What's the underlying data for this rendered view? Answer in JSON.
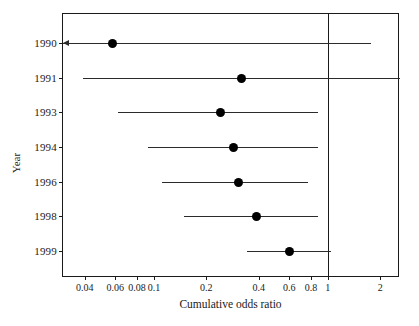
{
  "chart_data": {
    "type": "scatter",
    "subtype": "forest-plot-cumulative-meta-analysis",
    "title": "",
    "xlabel": "Cumulative odds ratio",
    "ylabel": "Year",
    "xscale": "log",
    "xlim": [
      0.03,
      2.6
    ],
    "grid": false,
    "legend": null,
    "reference_line": {
      "value": 1,
      "label": "1",
      "orientation": "vertical"
    },
    "x_ticks": [
      {
        "value": 0.04,
        "label": "0.04"
      },
      {
        "value": 0.06,
        "label": "0.06"
      },
      {
        "value": 0.08,
        "label": "0.08"
      },
      {
        "value": 0.1,
        "label": "0.1"
      },
      {
        "value": 0.2,
        "label": "0.2"
      },
      {
        "value": 0.4,
        "label": "0.4"
      },
      {
        "value": 0.6,
        "label": "0.6"
      },
      {
        "value": 0.8,
        "label": "0.8"
      },
      {
        "value": 1,
        "label": "1"
      },
      {
        "value": 2,
        "label": "2"
      }
    ],
    "categories": [
      "1990",
      "1991",
      "1993",
      "1994",
      "1996",
      "1998",
      "1999"
    ],
    "points": [
      {
        "year": "1990",
        "odds_ratio": 0.058,
        "ci_low": 0.03,
        "ci_high": 1.78,
        "ci_low_truncated": true
      },
      {
        "year": "1991",
        "odds_ratio": 0.32,
        "ci_low": 0.039,
        "ci_high": 2.6,
        "ci_high_truncated": true
      },
      {
        "year": "1993",
        "odds_ratio": 0.24,
        "ci_low": 0.062,
        "ci_high": 0.88,
        "ci_low_truncated": false
      },
      {
        "year": "1994",
        "odds_ratio": 0.285,
        "ci_low": 0.093,
        "ci_high": 0.88,
        "ci_low_truncated": false
      },
      {
        "year": "1996",
        "odds_ratio": 0.305,
        "ci_low": 0.112,
        "ci_high": 0.77,
        "ci_low_truncated": false
      },
      {
        "year": "1998",
        "odds_ratio": 0.39,
        "ci_low": 0.148,
        "ci_high": 0.88,
        "ci_low_truncated": false
      },
      {
        "year": "1999",
        "odds_ratio": 0.6,
        "ci_low": 0.345,
        "ci_high": 1.04,
        "ci_low_truncated": false
      }
    ]
  },
  "axes": {
    "x_title": "Cumulative odds ratio",
    "y_title": "Year"
  }
}
